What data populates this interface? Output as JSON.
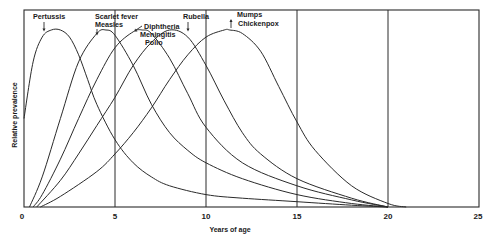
{
  "chart_data": {
    "type": "line",
    "title": "",
    "xlabel": "Years of age",
    "ylabel": "Relative prevalence",
    "xlim": [
      0,
      25
    ],
    "ylim": [
      0,
      1
    ],
    "x_ticks": [
      0,
      5,
      10,
      15,
      20,
      25
    ],
    "x_tick_labels": [
      "0",
      "5",
      "10",
      "15",
      "20",
      "25"
    ],
    "y_ticks": [],
    "grid": "vertical lines at 5, 10, 15, 20",
    "legend": "none (curves labeled directly with arrows at peaks)",
    "series": [
      {
        "name": "Pertussis",
        "labels": [
          "Pertussis"
        ],
        "peak_age": 2,
        "x": [
          0,
          0.5,
          1,
          1.5,
          2,
          2.5,
          3,
          3.5,
          4,
          5,
          6,
          7,
          8,
          10,
          12,
          15,
          18,
          20
        ],
        "values": [
          0.5,
          0.82,
          0.96,
          1.0,
          1.0,
          0.96,
          0.86,
          0.72,
          0.58,
          0.38,
          0.25,
          0.17,
          0.12,
          0.07,
          0.05,
          0.03,
          0.01,
          0.0
        ]
      },
      {
        "name": "Scarlet fever / Measles",
        "labels": [
          "Scarlet fever",
          "Measles"
        ],
        "peak_age": 4.5,
        "x": [
          0.3,
          1,
          2,
          3,
          4,
          4.5,
          5,
          6,
          7,
          8,
          9,
          10,
          12,
          15,
          18,
          20
        ],
        "values": [
          0.0,
          0.17,
          0.5,
          0.82,
          0.98,
          1.0,
          0.97,
          0.8,
          0.58,
          0.42,
          0.32,
          0.25,
          0.16,
          0.07,
          0.02,
          0.0
        ]
      },
      {
        "name": "Diphtheria / Meningitis / Polio",
        "labels": [
          "Diphtheria",
          "Meningitis",
          "Polio"
        ],
        "peak_age": 6.5,
        "x": [
          0.5,
          1,
          2,
          3,
          4,
          5,
          6,
          6.5,
          7,
          8,
          9,
          10,
          12,
          15,
          18,
          20
        ],
        "values": [
          0.0,
          0.07,
          0.27,
          0.5,
          0.72,
          0.9,
          0.99,
          1.0,
          0.98,
          0.84,
          0.64,
          0.45,
          0.25,
          0.12,
          0.04,
          0.0
        ]
      },
      {
        "name": "Rubella",
        "labels": [
          "Rubella"
        ],
        "peak_age": 8,
        "x": [
          0.7,
          2,
          3,
          4,
          5,
          6,
          7,
          8,
          9,
          10,
          11,
          12,
          13,
          15,
          18,
          20
        ],
        "values": [
          0.0,
          0.15,
          0.3,
          0.46,
          0.62,
          0.8,
          0.93,
          1.0,
          0.96,
          0.8,
          0.6,
          0.42,
          0.3,
          0.16,
          0.05,
          0.0
        ]
      },
      {
        "name": "Mumps / Chickenpox",
        "labels": [
          "Mumps",
          "Chickenpox"
        ],
        "peak_age": 11.3,
        "x": [
          0.9,
          2,
          4,
          5,
          6,
          7,
          8,
          9,
          10,
          11,
          11.3,
          12,
          13,
          14,
          15,
          16,
          18,
          20,
          21
        ],
        "values": [
          0.0,
          0.06,
          0.2,
          0.3,
          0.42,
          0.56,
          0.72,
          0.86,
          0.96,
          1.0,
          1.0,
          0.98,
          0.88,
          0.68,
          0.48,
          0.32,
          0.12,
          0.02,
          0.0
        ]
      }
    ],
    "annotations": [
      {
        "text": "Pertussis",
        "arrow_to_age": 1.9
      },
      {
        "text": "Scarlet fever",
        "arrow_to_age": 4.2
      },
      {
        "text": "Measles",
        "arrow_to_age": 4.2
      },
      {
        "text": "Diphtheria",
        "arrow_to_age": 6.2
      },
      {
        "text": "Meningitis",
        "arrow_to_age": 7.3
      },
      {
        "text": "Polio",
        "arrow_to_age": 7.3
      },
      {
        "text": "Rubella",
        "arrow_to_age": 9.1
      },
      {
        "text": "Mumps",
        "arrow_to_age": 11.2
      },
      {
        "text": "Chickenpox",
        "arrow_to_age": 11.2
      }
    ]
  },
  "axes": {
    "xlabel": "Years of age",
    "ylabel": "Relative prevalence",
    "x_tick_labels": [
      "0",
      "5",
      "10",
      "15",
      "20",
      "25"
    ]
  },
  "labels": {
    "pertussis": "Pertussis",
    "scarlet_fever": "Scarlet fever",
    "measles": "Measles",
    "diphtheria": "Diphtheria",
    "meningitis": "Meningitis",
    "polio": "Polio",
    "rubella": "Rubella",
    "mumps": "Mumps",
    "chickenpox": "Chickenpox"
  }
}
